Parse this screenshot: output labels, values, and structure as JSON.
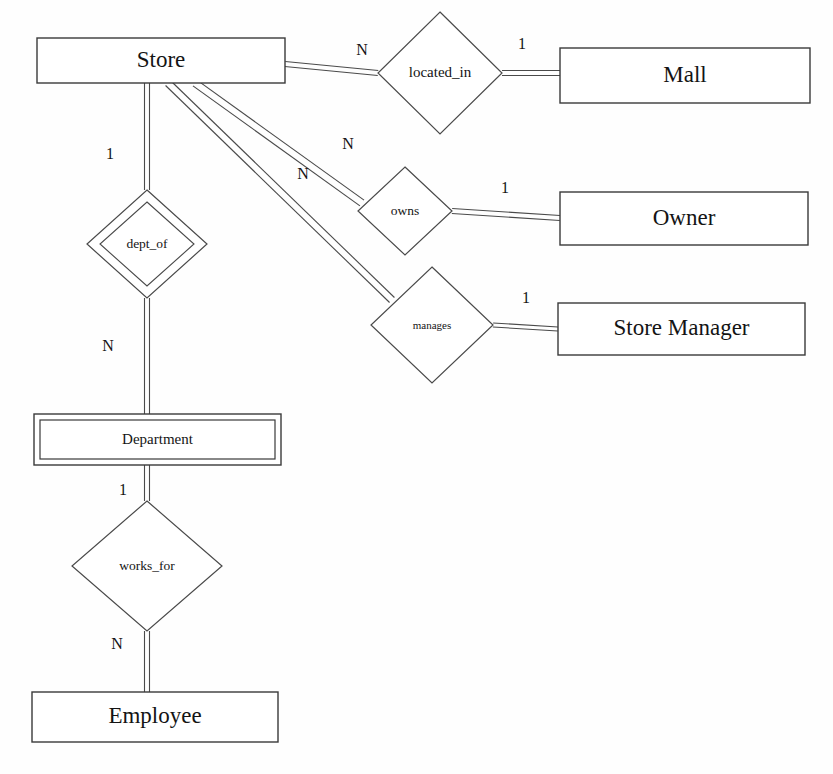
{
  "diagram": {
    "type": "entity-relationship-diagram",
    "canvas": {
      "width": 833,
      "height": 774
    },
    "stroke_color": "#4a4a4a",
    "text_color": "#141414",
    "background_color": "#fefefe"
  },
  "entities": [
    {
      "id": "store",
      "label": "Store",
      "kind": "strong",
      "x": 37,
      "y": 38,
      "w": 248,
      "h": 45,
      "font": "big"
    },
    {
      "id": "mall",
      "label": "Mall",
      "kind": "strong",
      "x": 560,
      "y": 48,
      "w": 250,
      "h": 55,
      "font": "big"
    },
    {
      "id": "owner",
      "label": "Owner",
      "kind": "strong",
      "x": 560,
      "y": 192,
      "w": 248,
      "h": 53,
      "font": "big"
    },
    {
      "id": "store_manager",
      "label": "Store Manager",
      "kind": "strong",
      "x": 558,
      "y": 303,
      "w": 247,
      "h": 52,
      "font": "big"
    },
    {
      "id": "department",
      "label": "Department",
      "kind": "weak",
      "x": 34,
      "y": 414,
      "w": 247,
      "h": 51,
      "font": "mid"
    },
    {
      "id": "employee",
      "label": "Employee",
      "kind": "strong",
      "x": 32,
      "y": 692,
      "w": 246,
      "h": 50,
      "font": "big"
    }
  ],
  "relationships": [
    {
      "id": "located_in",
      "label": "located_in",
      "kind": "normal",
      "cx": 440,
      "cy": 73,
      "rx": 62,
      "ry": 61,
      "font": "r-lg"
    },
    {
      "id": "owns",
      "label": "owns",
      "kind": "normal",
      "cx": 405,
      "cy": 211,
      "rx": 47,
      "ry": 44,
      "font": "r-md"
    },
    {
      "id": "manages",
      "label": "manages",
      "kind": "normal",
      "cx": 432,
      "cy": 325,
      "rx": 61,
      "ry": 58,
      "font": "r-sm"
    },
    {
      "id": "dept_of",
      "label": "dept_of",
      "kind": "identifying",
      "cx": 147,
      "cy": 244,
      "rx": 60,
      "ry": 54,
      "font": "r-md"
    },
    {
      "id": "works_for",
      "label": "works_for",
      "kind": "normal",
      "cx": 147,
      "cy": 566,
      "rx": 75,
      "ry": 65,
      "font": "r-md"
    }
  ],
  "cardinality_labels": [
    {
      "id": "store-located_in",
      "text": "N",
      "x": 362,
      "y": 51
    },
    {
      "id": "located_in-mall",
      "text": "1",
      "x": 522,
      "y": 45
    },
    {
      "id": "store-owns",
      "text": "N",
      "x": 348,
      "y": 145
    },
    {
      "id": "owns-owner",
      "text": "1",
      "x": 505,
      "y": 189
    },
    {
      "id": "store-manages",
      "text": "N",
      "x": 303,
      "y": 175
    },
    {
      "id": "manages-store_manager",
      "text": "1",
      "x": 526,
      "y": 299
    },
    {
      "id": "store-dept_of",
      "text": "1",
      "x": 110,
      "y": 155
    },
    {
      "id": "dept_of-department",
      "text": "N",
      "x": 108,
      "y": 347
    },
    {
      "id": "department-works_for",
      "text": "1",
      "x": 123,
      "y": 491
    },
    {
      "id": "works_for-employee",
      "text": "N",
      "x": 117,
      "y": 645
    }
  ],
  "connectors": [
    {
      "id": "conn-store-located_in",
      "from": "store",
      "to": "located_in",
      "a": [
        285,
        64
      ],
      "b": [
        378,
        73
      ],
      "offset": 5
    },
    {
      "id": "conn-located_in-mall",
      "from": "located_in",
      "to": "mall",
      "a": [
        502,
        73
      ],
      "b": [
        560,
        73
      ],
      "offset": 5
    },
    {
      "id": "conn-store-owns",
      "from": "store",
      "to": "owns",
      "a": [
        195,
        83
      ],
      "b": [
        362,
        203
      ],
      "offset": 7
    },
    {
      "id": "conn-owns-owner",
      "from": "owns",
      "to": "owner",
      "a": [
        452,
        211
      ],
      "b": [
        560,
        218
      ],
      "offset": 5
    },
    {
      "id": "conn-store-manages",
      "from": "store",
      "to": "manages",
      "a": [
        168,
        83
      ],
      "b": [
        392,
        300
      ],
      "offset": 7
    },
    {
      "id": "conn-manages-store_manager",
      "from": "manages",
      "to": "store_manager",
      "a": [
        493,
        325
      ],
      "b": [
        558,
        329
      ],
      "offset": 4
    },
    {
      "id": "conn-store-dept_of",
      "from": "store",
      "to": "dept_of",
      "a": [
        147,
        83
      ],
      "b": [
        147,
        190
      ],
      "offset": 5
    },
    {
      "id": "conn-dept_of-department",
      "from": "dept_of",
      "to": "department",
      "a": [
        147,
        298
      ],
      "b": [
        147,
        414
      ],
      "offset": 5
    },
    {
      "id": "conn-department-works_for",
      "from": "department",
      "to": "works_for",
      "a": [
        147,
        465
      ],
      "b": [
        147,
        501
      ],
      "offset": 5
    },
    {
      "id": "conn-works_for-employee",
      "from": "works_for",
      "to": "employee",
      "a": [
        147,
        631
      ],
      "b": [
        147,
        692
      ],
      "offset": 5
    }
  ]
}
